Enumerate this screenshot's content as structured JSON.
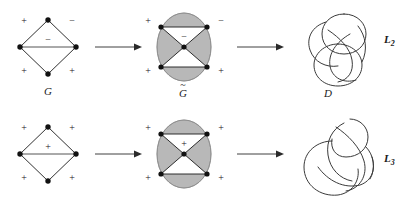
{
  "figure": {
    "rows": [
      {
        "id": "row-top",
        "graph": {
          "label": "G",
          "signs": {
            "top_left": "+",
            "top_right": "−",
            "middle": "−",
            "bottom_left": "+",
            "bottom_right": "+"
          }
        },
        "tilde": {
          "label": "G",
          "tilde_mark": "~",
          "signs": {
            "top_left": "+",
            "top_right": "−",
            "middle": "−",
            "bottom_left": "+",
            "bottom_right": "+"
          }
        },
        "diagram": {
          "label": "D",
          "link_name": "L",
          "link_index": "2"
        },
        "arrow1": "arrow-right",
        "arrow2": "arrow-right"
      },
      {
        "id": "row-bot",
        "graph": {
          "label": "",
          "signs": {
            "top_left": "+",
            "top_right": "+",
            "middle": "+",
            "bottom_left": "+",
            "bottom_right": "+"
          }
        },
        "tilde": {
          "label": "",
          "tilde_mark": "",
          "signs": {
            "top_left": "+",
            "top_right": "+",
            "middle": "+",
            "bottom_left": "+",
            "bottom_right": "+"
          }
        },
        "diagram": {
          "label": "",
          "link_name": "L",
          "link_index": "3"
        },
        "arrow1": "arrow-right",
        "arrow2": "arrow-right"
      }
    ],
    "colors": {
      "shade_fill": "#b8b8b8",
      "shade_stroke": "#8a8a8a",
      "ink": "#1a1a1a",
      "strand": "#3a3a3a",
      "background": "#ffffff"
    }
  }
}
